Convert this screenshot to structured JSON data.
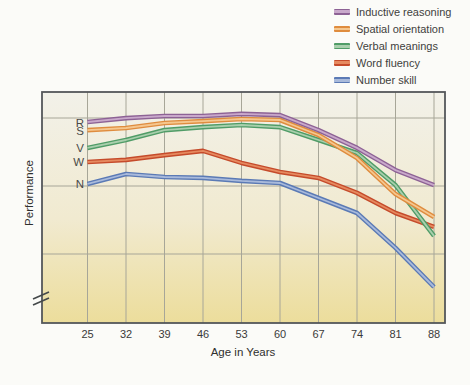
{
  "page": {
    "background": "#fbfbf8"
  },
  "colors": {
    "plot_bg_top": "#f2f1e9",
    "plot_bg_mid": "#f1ead0",
    "plot_bg_bottom": "#ecdd9b",
    "gridline": "#a7a698",
    "border": "#54575a",
    "axis_break": "#44484a"
  },
  "chart_data": {
    "type": "line",
    "xlabel": "Age in Years",
    "ylabel": "Performance",
    "categories": [
      25,
      32,
      39,
      46,
      53,
      60,
      67,
      74,
      81,
      88
    ],
    "ylim": [
      0,
      100
    ],
    "y_units": "relative (y-axis unlabeled, values estimated 0-100)",
    "y_axis_break": true,
    "grid": true,
    "legend_position": "top-right",
    "series": [
      {
        "name": "Inductive reasoning",
        "letter": "R",
        "color": "#8d6295",
        "highlight": "#c9a9cb",
        "values": [
          87.0,
          88.7,
          89.6,
          89.6,
          90.5,
          90.0,
          83.5,
          75.8,
          66.2,
          59.7
        ]
      },
      {
        "name": "Spatial orientation",
        "letter": "S",
        "color": "#df8c3e",
        "highlight": "#f5c78f",
        "values": [
          83.5,
          84.4,
          86.6,
          87.4,
          88.3,
          87.9,
          81.4,
          71.4,
          55.8,
          45.9
        ]
      },
      {
        "name": "Verbal meanings",
        "letter": "V",
        "color": "#509c67",
        "highlight": "#a9cfad",
        "values": [
          75.8,
          79.2,
          83.5,
          84.8,
          85.7,
          84.8,
          79.2,
          73.6,
          59.7,
          37.7
        ]
      },
      {
        "name": "Word fluency",
        "letter": "W",
        "color": "#c54b2b",
        "highlight": "#e68a60",
        "values": [
          69.7,
          70.6,
          72.7,
          74.5,
          69.3,
          65.4,
          62.8,
          56.3,
          47.6,
          41.6
        ]
      },
      {
        "name": "Number skill",
        "letter": "N",
        "color": "#5b7ab5",
        "highlight": "#a9badb",
        "values": [
          60.2,
          64.5,
          63.2,
          62.8,
          61.5,
          60.6,
          54.1,
          47.6,
          32.5,
          15.6
        ]
      }
    ]
  }
}
